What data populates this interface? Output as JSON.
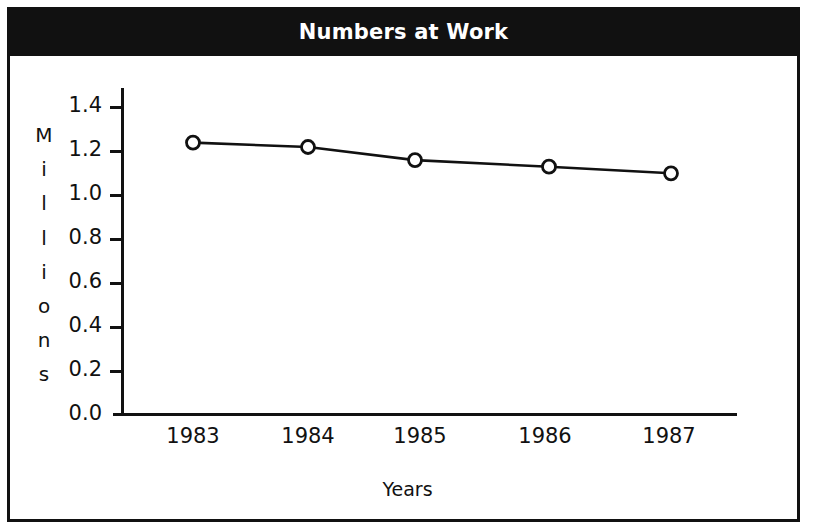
{
  "figure": {
    "title": "Numbers at Work",
    "title_bg_color": "#111111",
    "title_text_color": "#ffffff",
    "border_color": "#111111",
    "background_color": "#ffffff"
  },
  "chart_data": {
    "type": "line",
    "title": "Numbers at Work",
    "xlabel": "Years",
    "ylabel": "Millions",
    "ylabel_letters": [
      "M",
      "i",
      "l",
      "l",
      "i",
      "o",
      "n",
      "s"
    ],
    "categories": [
      "1983",
      "1984",
      "1985",
      "1986",
      "1987"
    ],
    "x": [
      1983,
      1984,
      1985,
      1986,
      1987
    ],
    "values": [
      1.24,
      1.22,
      1.16,
      1.13,
      1.1
    ],
    "series": [
      {
        "name": "Numbers at Work",
        "values": [
          1.24,
          1.22,
          1.16,
          1.13,
          1.1
        ]
      }
    ],
    "ylim": [
      0.0,
      1.5
    ],
    "ytick_labels": [
      "1.4",
      "1.2",
      "1.0",
      "0.8",
      "0.6",
      "0.4",
      "0.2",
      "0.0"
    ],
    "ytick_values": [
      1.4,
      1.2,
      1.0,
      0.8,
      0.6,
      0.4,
      0.2,
      0.0
    ],
    "grid": false,
    "legend": false,
    "marker": "open-circle",
    "line_color": "#111111",
    "marker_fill": "#ffffff"
  }
}
